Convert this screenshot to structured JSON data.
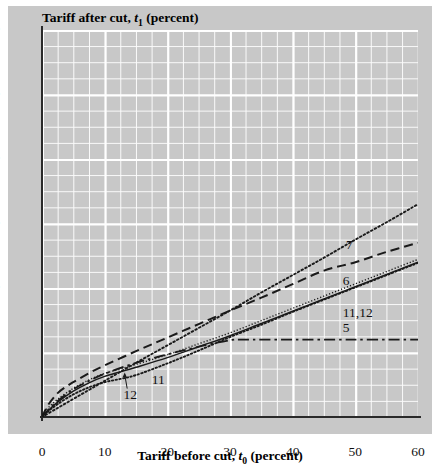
{
  "chart_data": {
    "type": "line",
    "title": "",
    "xlabel": "Tariff before cut, t0 (percent)",
    "ylabel": "Tariff after cut, t1 (percent)",
    "xlim": [
      0,
      60
    ],
    "ylim": [
      0,
      60
    ],
    "xticks": [
      0,
      10,
      20,
      30,
      40,
      50,
      60
    ],
    "yticks": [
      0,
      10,
      20,
      30,
      40,
      50,
      60
    ],
    "grid": true,
    "grid_minor_step": 2.5,
    "legend": "inline-labels",
    "series": [
      {
        "name": "7",
        "label": "7",
        "style": "dotted",
        "x": [
          0,
          2.5,
          5,
          7.5,
          10,
          15,
          20,
          25,
          30,
          35,
          40,
          45,
          50,
          55,
          60
        ],
        "y": [
          0,
          1.4,
          2.8,
          4.2,
          5.6,
          8.4,
          11.1,
          13.8,
          16.5,
          19.3,
          22.0,
          24.7,
          27.5,
          30.2,
          33.0
        ]
      },
      {
        "name": "6",
        "label": "6",
        "style": "dashed",
        "x": [
          0,
          1,
          2.5,
          4,
          5,
          7.5,
          10,
          15,
          20,
          25,
          30,
          35,
          40,
          45,
          50,
          55,
          60
        ],
        "y": [
          0,
          1.9,
          3.7,
          4.8,
          5.4,
          6.8,
          8.0,
          10.2,
          12.3,
          14.4,
          16.5,
          18.5,
          20.6,
          22.7,
          24.0,
          25.6,
          27.0
        ]
      },
      {
        "name": "11",
        "label": "11",
        "style": "solid",
        "x": [
          0,
          1,
          2.5,
          5,
          7.5,
          10,
          12.5,
          15,
          20,
          25,
          30,
          35,
          40,
          45,
          50,
          55,
          60
        ],
        "y": [
          0,
          1.0,
          2.3,
          4.0,
          5.3,
          6.3,
          7.0,
          7.7,
          9.2,
          10.9,
          12.6,
          14.5,
          16.4,
          18.3,
          20.2,
          22.1,
          24.0
        ]
      },
      {
        "name": "12",
        "label": "12",
        "style": "dotted-fine",
        "x": [
          0,
          1,
          2.5,
          5,
          7.5,
          10,
          12.5,
          15,
          20,
          25,
          30,
          35,
          40,
          45,
          50,
          55,
          60
        ],
        "y": [
          0,
          0.9,
          2.0,
          3.5,
          4.6,
          5.4,
          5.9,
          6.5,
          8.3,
          10.3,
          12.4,
          14.3,
          16.3,
          18.2,
          20.1,
          22.0,
          23.9
        ]
      },
      {
        "name": "5",
        "label": "5",
        "style": "dash-dot",
        "x": [
          0,
          1,
          2.5,
          5,
          7.5,
          10,
          15,
          20,
          25,
          30,
          32,
          40,
          50,
          60
        ],
        "y": [
          0,
          1.1,
          2.5,
          4.3,
          5.6,
          6.7,
          8.4,
          9.7,
          10.9,
          11.9,
          12.0,
          12.0,
          12.0,
          12.0
        ]
      }
    ],
    "curve_labels": [
      {
        "text": "7",
        "x": 48.5,
        "y": 26.5
      },
      {
        "text": "6",
        "x": 48.0,
        "y": 21.0
      },
      {
        "text": "11,12",
        "x": 48.0,
        "y": 16.0
      },
      {
        "text": "5",
        "x": 48.0,
        "y": 13.6
      },
      {
        "text": "11",
        "x": 17.5,
        "y": 5.6
      },
      {
        "text": "12",
        "x": 13.0,
        "y": 3.2
      }
    ]
  },
  "axis": {
    "y_title_main": "Tariff after cut,",
    "y_title_var": "t",
    "y_title_sub": "1",
    "y_title_unit": "(percent)",
    "x_title_main": "Tariff before cut,",
    "x_title_var": "t",
    "x_title_sub": "0",
    "x_title_unit": "(percent)"
  },
  "colors": {
    "panel": "#c8c8c8",
    "grid": "#ffffff",
    "ink": "#1a1a1a",
    "page": "#ffffff"
  }
}
